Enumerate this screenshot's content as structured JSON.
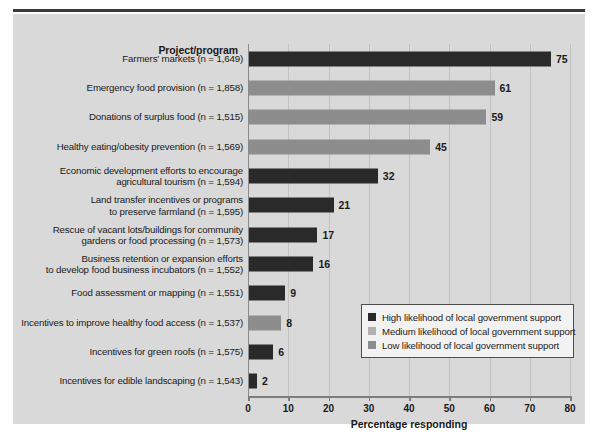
{
  "figure": {
    "cutoff_caption": "",
    "category_header": "Project/program",
    "x_axis_title": "Percentage responding"
  },
  "legend": {
    "items": [
      {
        "key": "high",
        "label": "High likelihood of local government support",
        "color": "#2a2a2a"
      },
      {
        "key": "medium",
        "label": "Medium likelihood of local government support",
        "color": "#b0b0b0"
      },
      {
        "key": "low",
        "label": "Low likelihood of local government support",
        "color": "#8d8d8d"
      }
    ]
  },
  "chart_data": {
    "type": "bar",
    "orientation": "horizontal",
    "title": "",
    "xlabel": "Percentage responding",
    "ylabel": "Project/program",
    "xlim": [
      0,
      80
    ],
    "xticks": [
      0,
      10,
      20,
      30,
      40,
      50,
      60,
      70,
      80
    ],
    "grid": true,
    "legend_position": "inside-right",
    "categories": [
      "Farmers' markets (n = 1,649)",
      "Emergency food provision (n = 1,858)",
      "Donations of surplus food (n = 1,515)",
      "Healthy eating/obesity prevention (n = 1,569)",
      "Economic development efforts to encourage\nagricultural tourism (n = 1,594)",
      "Land transfer incentives or programs\nto preserve farmland (n = 1,595)",
      "Rescue of vacant lots/buildings for community\ngardens or food processing (n = 1,573)",
      "Business retention or expansion efforts\nto develop food business incubators (n = 1,552)",
      "Food assessment or mapping (n = 1,551)",
      "Incentives to improve healthy food access (n  = 1,537)",
      "Incentives for green roofs (n = 1,575)",
      "Incentives for edible landscaping (n = 1,543)"
    ],
    "values": [
      75,
      61,
      59,
      45,
      32,
      21,
      17,
      16,
      9,
      8,
      6,
      2
    ],
    "series_keys": [
      "high",
      "medium",
      "medium",
      "medium",
      "high",
      "high",
      "high",
      "high",
      "high",
      "medium",
      "high",
      "high"
    ],
    "bars": [
      {
        "label": "Farmers' markets (n = 1,649)",
        "value": 75,
        "series": "high"
      },
      {
        "label": "Emergency food provision (n = 1,858)",
        "value": 61,
        "series": "low"
      },
      {
        "label": "Donations of surplus food (n = 1,515)",
        "value": 59,
        "series": "low"
      },
      {
        "label": "Healthy eating/obesity prevention (n = 1,569)",
        "value": 45,
        "series": "low"
      },
      {
        "label": "Economic development efforts to encourage\nagricultural tourism (n = 1,594)",
        "value": 32,
        "series": "high"
      },
      {
        "label": "Land transfer incentives or programs\nto preserve farmland (n = 1,595)",
        "value": 21,
        "series": "high"
      },
      {
        "label": "Rescue of vacant lots/buildings for community\ngardens or food processing (n = 1,573)",
        "value": 17,
        "series": "high"
      },
      {
        "label": "Business retention or expansion efforts\nto develop food business incubators (n = 1,552)",
        "value": 16,
        "series": "high"
      },
      {
        "label": "Food assessment or mapping (n = 1,551)",
        "value": 9,
        "series": "high"
      },
      {
        "label": "Incentives to improve healthy food access (n  = 1,537)",
        "value": 8,
        "series": "low"
      },
      {
        "label": "Incentives for green roofs (n = 1,575)",
        "value": 6,
        "series": "high"
      },
      {
        "label": "Incentives for edible landscaping (n = 1,543)",
        "value": 2,
        "series": "high"
      }
    ]
  }
}
